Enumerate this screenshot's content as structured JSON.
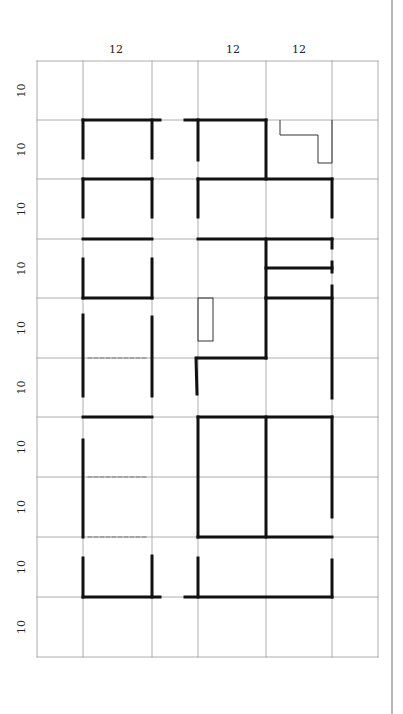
{
  "diagram": {
    "col_labels": [
      {
        "text": "12",
        "x": 116
      },
      {
        "text": "12",
        "x": 233
      },
      {
        "text": "12",
        "x": 299
      }
    ],
    "row_labels": [
      "10",
      "10",
      "10",
      "10",
      "10",
      "10",
      "10",
      "10",
      "10",
      "10"
    ],
    "grid": {
      "x": [
        37,
        83,
        152,
        198,
        266,
        332,
        378
      ],
      "y": [
        61,
        120,
        179,
        239,
        298,
        358,
        417,
        477,
        537,
        597,
        657
      ]
    },
    "colors": {
      "grid": "#999999",
      "wall": "#111111",
      "thin": "#333333"
    }
  }
}
